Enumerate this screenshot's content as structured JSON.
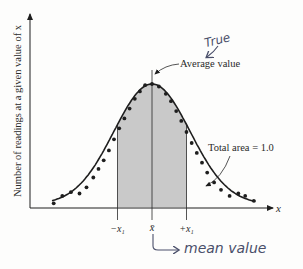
{
  "chart_data": {
    "type": "line",
    "title": "",
    "xlabel": "x",
    "ylabel": "Number of readings at a given value of x",
    "distribution": "normal",
    "mean_label": "x̄",
    "band": {
      "lower_label": "−x₁",
      "upper_label": "+x₁",
      "lower_sigma": -1,
      "upper_sigma": 1
    },
    "x_range_sigma": [
      -2.9,
      3.0
    ],
    "data_points_sigma": [
      {
        "x": -2.85,
        "y": 0.03
      },
      {
        "x": -2.6,
        "y": 0.09
      },
      {
        "x": -2.35,
        "y": 0.12
      },
      {
        "x": -2.1,
        "y": 0.11
      },
      {
        "x": -1.9,
        "y": 0.16
      },
      {
        "x": -1.7,
        "y": 0.24
      },
      {
        "x": -1.55,
        "y": 0.31
      },
      {
        "x": -1.4,
        "y": 0.38
      },
      {
        "x": -1.25,
        "y": 0.46
      },
      {
        "x": -1.1,
        "y": 0.55
      },
      {
        "x": -0.95,
        "y": 0.64
      },
      {
        "x": -0.8,
        "y": 0.72
      },
      {
        "x": -0.65,
        "y": 0.8
      },
      {
        "x": -0.5,
        "y": 0.88
      },
      {
        "x": -0.35,
        "y": 0.94
      },
      {
        "x": -0.2,
        "y": 0.99
      },
      {
        "x": 0.0,
        "y": 1.0
      },
      {
        "x": 0.2,
        "y": 0.98
      },
      {
        "x": 0.4,
        "y": 0.92
      },
      {
        "x": 0.55,
        "y": 0.86
      },
      {
        "x": 0.7,
        "y": 0.78
      },
      {
        "x": 0.85,
        "y": 0.7
      },
      {
        "x": 1.0,
        "y": 0.61
      },
      {
        "x": 1.15,
        "y": 0.52
      },
      {
        "x": 1.3,
        "y": 0.44
      },
      {
        "x": 1.45,
        "y": 0.36
      },
      {
        "x": 1.6,
        "y": 0.28
      },
      {
        "x": 1.8,
        "y": 0.2
      },
      {
        "x": 2.0,
        "y": 0.14
      },
      {
        "x": 2.25,
        "y": 0.09
      },
      {
        "x": 2.5,
        "y": 0.11
      },
      {
        "x": 2.7,
        "y": 0.09
      },
      {
        "x": 2.95,
        "y": 0.05
      }
    ]
  },
  "annotations": {
    "average_value": "Average value",
    "total_area": "Total area = 1.0",
    "handwritten_true": "True",
    "handwritten_mean": "mean value"
  },
  "colors": {
    "shade": "#c9c9c9",
    "line": "#1e1e1e",
    "ink": "#4a4f6a"
  }
}
